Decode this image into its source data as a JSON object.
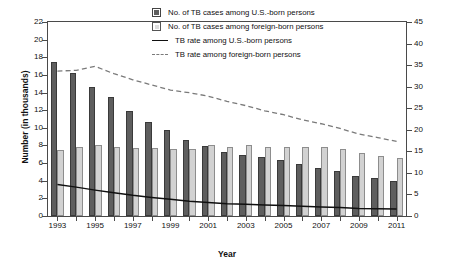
{
  "chart_data": {
    "type": "bar",
    "title": "",
    "subtitle": "",
    "xlabel": "Year",
    "ylabel": "Number (in thousands)",
    "y2label": "Rate (per 100,000 population)",
    "grid": false,
    "legend_position": "top-right",
    "categories": [
      1993,
      1994,
      1995,
      1996,
      1997,
      1998,
      1999,
      2000,
      2001,
      2002,
      2003,
      2004,
      2005,
      2006,
      2007,
      2008,
      2009,
      2010,
      2011
    ],
    "tick_labels_x": [
      "1993",
      "",
      "1995",
      "",
      "1997",
      "",
      "1999",
      "",
      "2001",
      "",
      "2003",
      "",
      "2005",
      "",
      "2007",
      "",
      "2009",
      "",
      "2011"
    ],
    "ylim": [
      0,
      22
    ],
    "yticks": [
      0,
      2,
      4,
      6,
      8,
      10,
      12,
      14,
      16,
      18,
      20,
      22
    ],
    "y2lim": [
      0,
      45
    ],
    "y2ticks": [
      0,
      5,
      10,
      15,
      20,
      25,
      30,
      35,
      40,
      45
    ],
    "series": [
      {
        "name": "No. of TB cases among U.S.-born persons",
        "type": "bar",
        "axis": "left",
        "color": "#5e5e5e",
        "values": [
          17.5,
          16.2,
          14.65,
          13.45,
          11.95,
          10.65,
          9.8,
          8.65,
          7.95,
          7.3,
          6.95,
          6.65,
          6.35,
          5.85,
          5.45,
          5.15,
          4.55,
          4.35,
          3.95
        ]
      },
      {
        "name": "No. of TB cases among foreign-born persons",
        "type": "bar",
        "axis": "left",
        "color": "#d2d2d2",
        "values": [
          7.45,
          7.8,
          8.05,
          7.8,
          7.75,
          7.7,
          7.65,
          7.6,
          8.0,
          7.8,
          8.0,
          7.85,
          7.85,
          7.85,
          7.85,
          7.55,
          7.1,
          6.8,
          6.55
        ]
      },
      {
        "name": "TB rate among U.S.-born persons",
        "type": "line",
        "style": "solid",
        "axis": "right",
        "color": "#101010",
        "values": [
          7.3,
          6.7,
          6.0,
          5.4,
          4.8,
          4.3,
          3.9,
          3.45,
          3.15,
          2.85,
          2.7,
          2.55,
          2.45,
          2.25,
          2.1,
          1.95,
          1.75,
          1.7,
          1.6
        ]
      },
      {
        "name": "TB rate among foreign-born persons",
        "type": "line",
        "style": "dashed",
        "axis": "right",
        "color": "#7a7a7a",
        "values": [
          33.6,
          33.8,
          34.7,
          33.0,
          31.6,
          30.4,
          29.2,
          28.6,
          27.8,
          26.6,
          25.6,
          24.4,
          23.5,
          22.3,
          21.4,
          20.3,
          19.0,
          18.2,
          17.3
        ]
      }
    ],
    "legend": [
      {
        "label": "No. of TB cases among U.S.-born persons",
        "marker": "filled-square-dark"
      },
      {
        "label": "No. of TB cases among foreign-born persons",
        "marker": "filled-square-light"
      },
      {
        "label": "TB rate among U.S.-born persons",
        "marker": "solid-line"
      },
      {
        "label": "TB rate among foreign-born persons",
        "marker": "dashed-line"
      }
    ]
  }
}
